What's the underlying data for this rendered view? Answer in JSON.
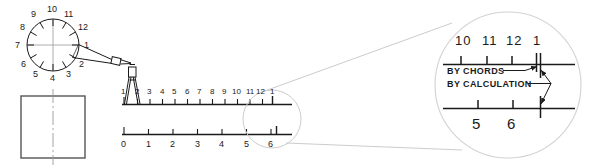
{
  "figure": {
    "ink_color": "#1a1a1a",
    "construction_color": "#b9b9b9",
    "centerline_color": "#9a9a9a"
  },
  "dial": {
    "name": "twelve-division-circle",
    "division_count": 12,
    "numbers": [
      "1",
      "2",
      "3",
      "4",
      "5",
      "6",
      "7",
      "8",
      "9",
      "10",
      "11",
      "12"
    ],
    "number_positions_deg": [
      0,
      330,
      300,
      270,
      240,
      210,
      180,
      150,
      120,
      90,
      60,
      30
    ],
    "has_center_crosshair": true,
    "tool": "dividers"
  },
  "plate": {
    "name": "rectangular-plate",
    "has_vertical_centerline": true
  },
  "dividers": {
    "name": "dividers-tool",
    "spanning_from": "1",
    "spanning_to": "2"
  },
  "scale_chords": {
    "name": "chord-scale",
    "caption": "BY CHORDS",
    "labels": [
      "1",
      "2",
      "3",
      "4",
      "5",
      "6",
      "7",
      "8",
      "9",
      "10",
      "11",
      "12",
      "1"
    ],
    "tick_count": 13,
    "origin_label": "1"
  },
  "scale_calculated": {
    "name": "calculated-scale",
    "caption": "BY CALCULATION",
    "labels": [
      "0",
      "1",
      "2",
      "3",
      "4",
      "5",
      "6"
    ],
    "tick_count": 7,
    "has_overrun_tick": true
  },
  "detail": {
    "name": "enlarged-detail-view",
    "top_labels": [
      "10",
      "11",
      "12",
      "1"
    ],
    "bottom_labels": [
      "5",
      "6"
    ],
    "annotations": [
      {
        "text": "BY CHORDS",
        "target": "chord-scale-end-tick"
      },
      {
        "text": "BY CALCULATION",
        "target": "calculated-scale-end-tick"
      }
    ],
    "shows_error_between_methods": true
  }
}
